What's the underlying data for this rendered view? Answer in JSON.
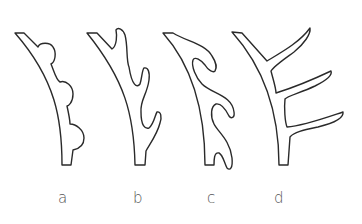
{
  "figure": {
    "panels": [
      {
        "id": "a",
        "label": "a",
        "description": "stem with three rounded bumps"
      },
      {
        "id": "b",
        "label": "b",
        "description": "stem with three short curved prongs"
      },
      {
        "id": "c",
        "label": "c",
        "description": "stem with three hooked prongs"
      },
      {
        "id": "d",
        "label": "d",
        "description": "stem with three long straight branches"
      }
    ],
    "colors": {
      "stroke": "#2a2a2a",
      "label": "#555555",
      "background": "#ffffff"
    }
  }
}
